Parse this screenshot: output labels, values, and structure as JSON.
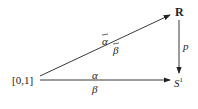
{
  "diagram": {
    "nodes": {
      "interval": "[0,1]",
      "reals": "R",
      "circle": "S",
      "circle_sup": "1"
    },
    "edges": {
      "diagonal_top": "α",
      "diagonal_bottom": "β",
      "horizontal_top": "α",
      "horizontal_bottom": "β",
      "vertical": "p"
    },
    "colors": {
      "line": "#222222",
      "background": "#ffffff"
    }
  }
}
